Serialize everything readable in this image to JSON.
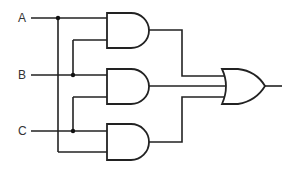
{
  "diagram": {
    "title": "",
    "type": "logic-circuit",
    "inputs": [
      {
        "label": "A",
        "y": 18
      },
      {
        "label": "B",
        "y": 75
      },
      {
        "label": "C",
        "y": 131
      }
    ],
    "gates": [
      {
        "id": "and1",
        "type": "AND",
        "inputs": [
          "A",
          "B"
        ]
      },
      {
        "id": "and2",
        "type": "AND",
        "inputs": [
          "B",
          "C"
        ]
      },
      {
        "id": "and3",
        "type": "AND",
        "inputs": [
          "C",
          "A"
        ]
      },
      {
        "id": "or1",
        "type": "OR",
        "inputs": [
          "and1",
          "and2",
          "and3"
        ]
      }
    ],
    "output": "or1",
    "colors": {
      "line": "#222222",
      "background": "#ffffff",
      "label": "#333333"
    }
  }
}
